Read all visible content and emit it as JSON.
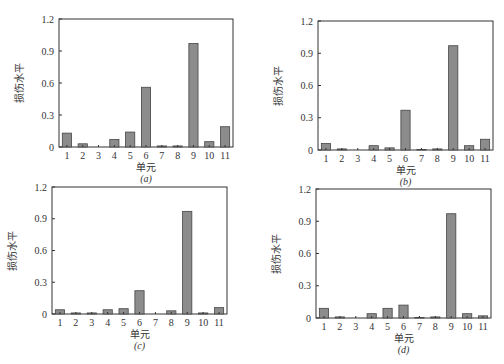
{
  "chart_data": [
    {
      "type": "bar",
      "panel": "(a)",
      "subtitle": "(a)",
      "xlabel": "单元",
      "ylabel": "损伤水平",
      "categories": [
        "1",
        "2",
        "3",
        "4",
        "5",
        "6",
        "7",
        "8",
        "9",
        "10",
        "11"
      ],
      "values": [
        0.13,
        0.03,
        0.0,
        0.07,
        0.14,
        0.56,
        0.01,
        0.01,
        0.97,
        0.05,
        0.19
      ],
      "ylim": [
        0,
        1.2
      ],
      "yticks": [
        0,
        0.3,
        0.6,
        0.9,
        1.2
      ],
      "ytick_labels": [
        "0",
        "0.3",
        "0.6",
        "0.9",
        "1.2"
      ],
      "grid": false,
      "bar_color": "#8c8c8c",
      "frame": {
        "left": 59,
        "top": 19,
        "right": 233,
        "bottom": 147
      }
    },
    {
      "type": "bar",
      "panel": "(b)",
      "subtitle": "(b)",
      "xlabel": "单元",
      "ylabel": "损伤水平",
      "categories": [
        "1",
        "2",
        "3",
        "4",
        "5",
        "6",
        "7",
        "8",
        "9",
        "10",
        "11"
      ],
      "values": [
        0.06,
        0.01,
        0.0,
        0.04,
        0.02,
        0.37,
        0.005,
        0.01,
        0.97,
        0.04,
        0.1
      ],
      "ylim": [
        0,
        1.2
      ],
      "yticks": [
        0,
        0.3,
        0.6,
        0.9,
        1.2
      ],
      "ytick_labels": [
        "0",
        "0.3",
        "0.6",
        "0.9",
        "1.2"
      ],
      "grid": false,
      "bar_color": "#8c8c8c",
      "frame": {
        "left": 318,
        "top": 21,
        "right": 493,
        "bottom": 150
      }
    },
    {
      "type": "bar",
      "panel": "(c)",
      "subtitle": "(c)",
      "xlabel": "单元",
      "ylabel": "损伤水平",
      "categories": [
        "1",
        "2",
        "3",
        "4",
        "5",
        "6",
        "7",
        "8",
        "9",
        "10",
        "11"
      ],
      "values": [
        0.04,
        0.01,
        0.01,
        0.04,
        0.05,
        0.22,
        0.0,
        0.03,
        0.97,
        0.01,
        0.06
      ],
      "ylim": [
        0,
        1.2
      ],
      "yticks": [
        0,
        0.3,
        0.6,
        0.9,
        1.2
      ],
      "ytick_labels": [
        "0",
        "0.3",
        "0.6",
        "0.9",
        "1.2"
      ],
      "grid": false,
      "bar_color": "#8c8c8c",
      "frame": {
        "left": 52,
        "top": 187,
        "right": 227,
        "bottom": 314
      }
    },
    {
      "type": "bar",
      "panel": "(d)",
      "subtitle": "(d)",
      "xlabel": "单元",
      "ylabel": "损伤水平",
      "categories": [
        "1",
        "2",
        "3",
        "4",
        "5",
        "6",
        "7",
        "8",
        "9",
        "10",
        "11"
      ],
      "values": [
        0.09,
        0.01,
        0.0,
        0.04,
        0.09,
        0.12,
        0.005,
        0.01,
        0.97,
        0.04,
        0.02
      ],
      "ylim": [
        0,
        1.2
      ],
      "yticks": [
        0,
        0.3,
        0.6,
        0.9,
        1.2
      ],
      "ytick_labels": [
        "0",
        "0.3",
        "0.6",
        "0.9",
        "1.2"
      ],
      "grid": false,
      "bar_color": "#8c8c8c",
      "frame": {
        "left": 316,
        "top": 189,
        "right": 491,
        "bottom": 318
      }
    }
  ],
  "panels": [
    {
      "subtitle": "(a)",
      "xlabel": "单元",
      "ylabel": "损伤水平"
    },
    {
      "subtitle": "(b)",
      "xlabel": "单元",
      "ylabel": "损伤水平"
    },
    {
      "subtitle": "(c)",
      "xlabel": "单元",
      "ylabel": "损伤水平"
    },
    {
      "subtitle": "(d)",
      "xlabel": "单元",
      "ylabel": "损伤水平"
    }
  ]
}
